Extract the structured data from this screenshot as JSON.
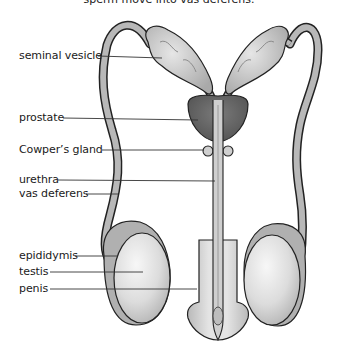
{
  "caption": "sperm move into vas deferens.",
  "labels": [
    {
      "id": "seminal-vesicle",
      "text": "seminal vesicle",
      "x": 19,
      "y": 50,
      "line": [
        98,
        56,
        162,
        58
      ]
    },
    {
      "id": "prostate",
      "text": "prostate",
      "x": 19,
      "y": 112,
      "line": [
        63,
        118,
        198,
        120
      ]
    },
    {
      "id": "cowpers-gland",
      "text": "Cowper’s gland",
      "x": 19,
      "y": 145,
      "line": [
        102,
        150,
        206,
        150
      ]
    },
    {
      "id": "urethra",
      "text": "urethra",
      "x": 19,
      "y": 174,
      "line": [
        58,
        180,
        215,
        181
      ]
    },
    {
      "id": "vas-deferens",
      "text": "vas deferens",
      "x": 19,
      "y": 188,
      "line": [
        86,
        194,
        118,
        194
      ]
    },
    {
      "id": "epididymis",
      "text": "epididymis",
      "x": 19,
      "y": 250,
      "line": [
        75,
        256,
        118,
        256
      ]
    },
    {
      "id": "testis",
      "text": "testis",
      "x": 19,
      "y": 266,
      "line": [
        50,
        272,
        143,
        272
      ]
    },
    {
      "id": "penis",
      "text": "penis",
      "x": 19,
      "y": 283,
      "line": [
        50,
        289,
        195,
        289
      ]
    }
  ],
  "colors": {
    "outline": "#222222",
    "duct": "#b8b8b8",
    "vesicle": "#c9c9c9",
    "prostate": "#6f6f6f",
    "testis": "#e2e2e2",
    "epididymis": "#a8a8a8",
    "penis": "#d4d4d4"
  }
}
